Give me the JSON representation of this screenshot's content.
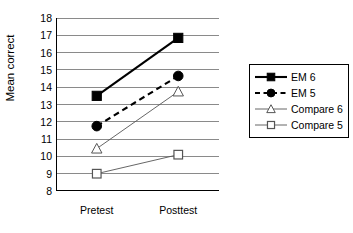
{
  "chart_data": {
    "type": "line",
    "title": "",
    "xlabel": "",
    "ylabel": "Mean correct",
    "categories": [
      "Pretest",
      "Posttest"
    ],
    "ylim": [
      8,
      18
    ],
    "yticks": [
      8,
      9,
      10,
      11,
      12,
      13,
      14,
      15,
      16,
      17,
      18
    ],
    "grid": "horizontal",
    "legend_position": "right",
    "series": [
      {
        "name": "EM 6",
        "values": [
          13.5,
          16.85
        ],
        "marker": "filled-square",
        "line": "solid",
        "width": "thick",
        "color": "#000000"
      },
      {
        "name": "EM 5",
        "values": [
          11.75,
          14.65
        ],
        "marker": "filled-circle",
        "line": "dashed",
        "width": "thick",
        "color": "#000000"
      },
      {
        "name": "Compare 6",
        "values": [
          10.45,
          13.75
        ],
        "marker": "open-triangle",
        "line": "solid",
        "width": "thin",
        "color": "#555555"
      },
      {
        "name": "Compare 5",
        "values": [
          9.0,
          10.1
        ],
        "marker": "open-square",
        "line": "solid",
        "width": "thin",
        "color": "#555555"
      }
    ]
  },
  "legend": {
    "items": [
      {
        "label": "EM 6"
      },
      {
        "label": "EM 5"
      },
      {
        "label": "Compare 6"
      },
      {
        "label": "Compare 5"
      }
    ]
  },
  "axis": {
    "y_title": "Mean correct",
    "y_labels": [
      "18",
      "17",
      "16",
      "15",
      "14",
      "13",
      "12",
      "11",
      "10",
      "9",
      "8"
    ],
    "x_labels": [
      "Pretest",
      "Posttest"
    ]
  }
}
